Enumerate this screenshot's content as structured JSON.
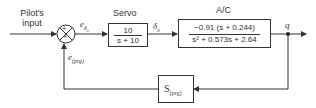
{
  "diagram": {
    "input_label_line1": "Pilot's",
    "input_label_line2": "input",
    "error_signal": "e",
    "error_signal_sub": "δ",
    "error_signal_subsub": "c",
    "feedback_signal": "e",
    "feedback_signal_sub": "(prg)",
    "summing_junction": {
      "top_sign": "+",
      "bottom_sign": "+"
    },
    "servo": {
      "title": "Servo",
      "numerator": "10",
      "denominator": "s + 10"
    },
    "servo_output": "δ",
    "servo_output_sub": "e",
    "aircraft": {
      "title": "A/C",
      "numerator": "−0.91 (s + 0.244)",
      "denominator": "s² + 0.573s + 2.64"
    },
    "output_label": "q",
    "feedback_block": {
      "label": "S",
      "label_sub": "(prg)"
    }
  },
  "colors": {
    "line": "#333333",
    "background": "#ffffff"
  }
}
